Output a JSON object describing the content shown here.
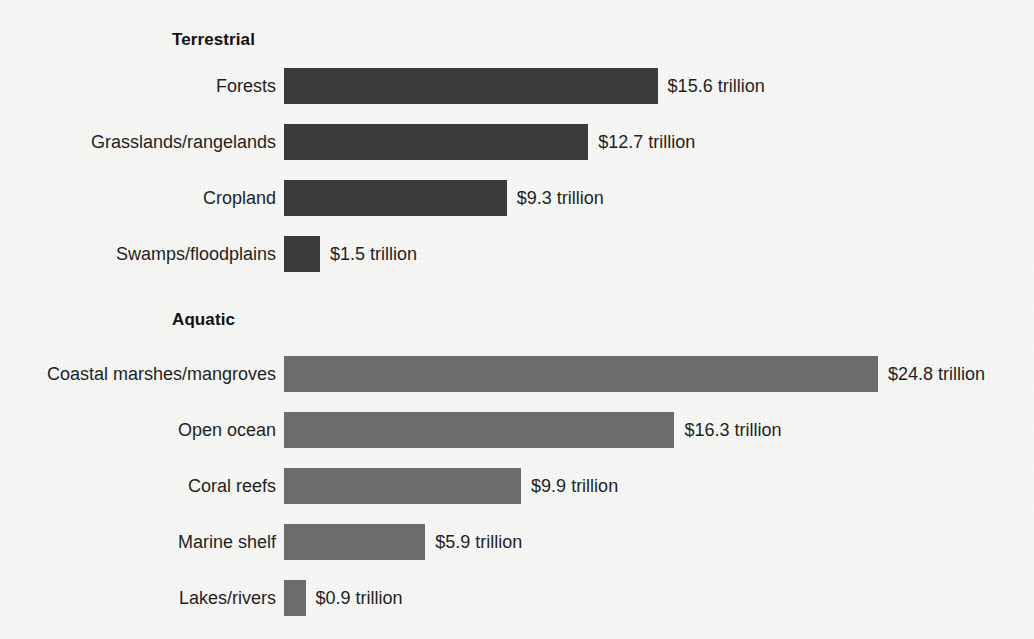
{
  "background_color": "#f6f6f4",
  "sections": [
    {
      "title": "Terrestrial",
      "title_x": 172,
      "title_y": 30,
      "bar_color": "#3b3b3b",
      "rows": [
        {
          "label": "Forests",
          "value": 15.6,
          "value_label": "$15.6 trillion",
          "y": 68
        },
        {
          "label": "Grasslands/rangelands",
          "value": 12.7,
          "value_label": "$12.7 trillion",
          "y": 124
        },
        {
          "label": "Cropland",
          "value": 9.3,
          "value_label": "$9.3 trillion",
          "y": 180
        },
        {
          "label": "Swamps/floodplains",
          "value": 1.5,
          "value_label": "$1.5 trillion",
          "y": 236
        }
      ]
    },
    {
      "title": "Aquatic",
      "title_x": 172,
      "title_y": 310,
      "bar_color": "#6c6c6c",
      "rows": [
        {
          "label": "Coastal marshes/mangroves",
          "value": 24.8,
          "value_label": "$24.8 trillion",
          "y": 356
        },
        {
          "label": "Open ocean",
          "value": 16.3,
          "value_label": "$16.3 trillion",
          "y": 412
        },
        {
          "label": "Coral reefs",
          "value": 9.9,
          "value_label": "$9.9 trillion",
          "y": 468
        },
        {
          "label": "Marine shelf",
          "value": 5.9,
          "value_label": "$5.9 trillion",
          "y": 524
        },
        {
          "label": "Lakes/rivers",
          "value": 0.9,
          "value_label": "$0.9 trillion",
          "y": 580
        }
      ]
    }
  ],
  "geometry": {
    "bar_origin_x": 284,
    "px_per_trillion": 23.95,
    "bar_height": 36,
    "label_right_edge": 276,
    "value_gap": 10
  },
  "chart_data": {
    "type": "bar",
    "orientation": "horizontal",
    "title": "",
    "subtitle": "",
    "xlabel": "",
    "ylabel": "",
    "unit": "trillion US dollars per year",
    "grid": false,
    "legend": "none",
    "axis_visible": false,
    "xlim": [
      0,
      24.8
    ],
    "groups": [
      {
        "name": "Terrestrial",
        "color": "#3b3b3b",
        "categories": [
          "Forests",
          "Grasslands/rangelands",
          "Cropland",
          "Swamps/floodplains"
        ],
        "values": [
          15.6,
          12.7,
          9.3,
          1.5
        ],
        "data_labels": [
          "$15.6 trillion",
          "$12.7 trillion",
          "$9.3 trillion",
          "$1.5 trillion"
        ]
      },
      {
        "name": "Aquatic",
        "color": "#6c6c6c",
        "categories": [
          "Coastal marshes/mangroves",
          "Open ocean",
          "Coral reefs",
          "Marine shelf",
          "Lakes/rivers"
        ],
        "values": [
          24.8,
          16.3,
          9.9,
          5.9,
          0.9
        ],
        "data_labels": [
          "$24.8 trillion",
          "$16.3 trillion",
          "$9.9 trillion",
          "$5.9 trillion",
          "$0.9 trillion"
        ]
      }
    ]
  }
}
